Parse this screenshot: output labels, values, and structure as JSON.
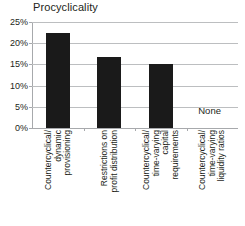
{
  "chart_data": {
    "type": "bar",
    "title": "Procyclicality",
    "xlabel": "",
    "ylabel": "",
    "ylim": [
      0,
      25
    ],
    "ytick_labels": [
      "25%",
      "20%",
      "15%",
      "10%",
      "5%",
      "0%"
    ],
    "ytick_values": [
      25,
      20,
      15,
      10,
      5,
      0
    ],
    "grid": true,
    "legend": false,
    "categories": [
      "Countercyclical/ dynamic provisioning",
      "Restrictions on profit distribution",
      "Countercyclical/ time-varying capital requirements",
      "Countercyclical/ time-varying liquidity ratios"
    ],
    "category_label_lines": [
      [
        "Countercyclical/",
        "dynamic",
        "provisioning"
      ],
      [
        "Restrictions on",
        "profit distribution"
      ],
      [
        "Countercyclical/",
        "time-varying",
        "capital",
        "requirements"
      ],
      [
        "Countercyclical/",
        "time-varying",
        "liquidity ratios"
      ]
    ],
    "values": [
      22.5,
      16.8,
      15.0,
      0
    ],
    "annotations": [
      {
        "text": "None",
        "category_index": 3
      }
    ],
    "bar_color": "#1a1a1a",
    "gridline_color": "#bcbec0",
    "axis_color": "#a7a9ac"
  }
}
